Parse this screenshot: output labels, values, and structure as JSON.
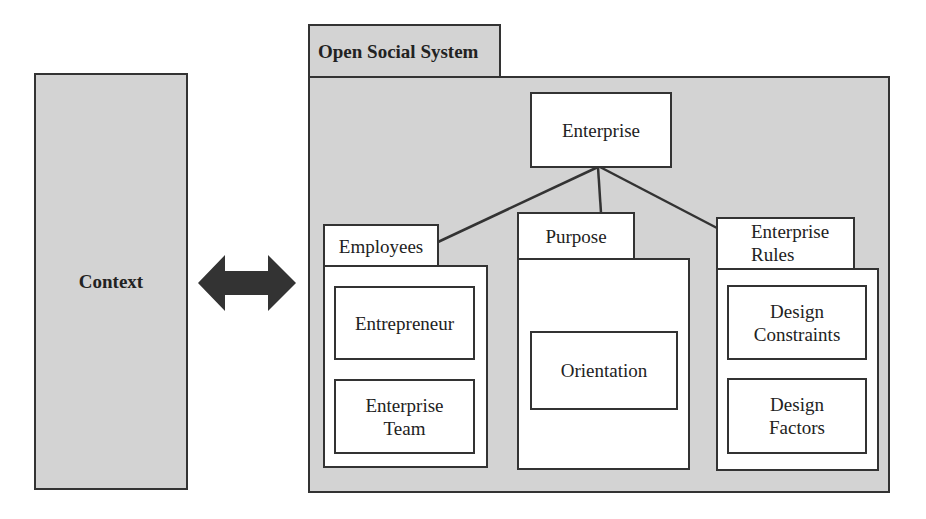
{
  "context": {
    "label": "Context"
  },
  "arrow": {
    "icon": "double-headed-arrow-icon",
    "color": "#333333"
  },
  "system": {
    "title": "Open Social System",
    "root": {
      "label": "Enterprise"
    },
    "groups": [
      {
        "tab": "Employees",
        "items": [
          "Entrepreneur",
          "Enterprise Team"
        ]
      },
      {
        "tab": "Purpose",
        "items": [
          "Orientation"
        ]
      },
      {
        "tab": "Enterprise Rules",
        "items": [
          "Design Constraints",
          "Design Factors"
        ]
      }
    ]
  },
  "colors": {
    "panel_fill": "#d3d3d3",
    "box_fill": "#ffffff",
    "stroke": "#333333"
  }
}
